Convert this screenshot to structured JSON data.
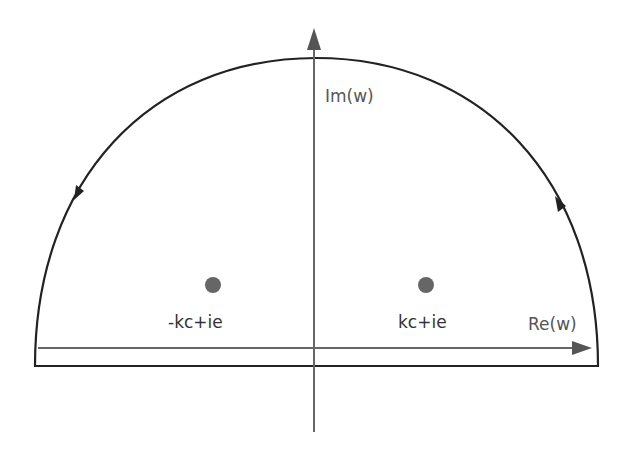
{
  "diagram": {
    "axes": {
      "imaginary_label": "Im(w)",
      "real_label": "Re(w)"
    },
    "poles": [
      {
        "label": "-kc+ie",
        "position": "left"
      },
      {
        "label": "kc+ie",
        "position": "right"
      }
    ],
    "contour": {
      "shape": "semicircle",
      "direction": "counterclockwise",
      "arrows": [
        "right-arc-up",
        "left-arc-down"
      ]
    },
    "colors": {
      "contour": "#222222",
      "axes": "#666666",
      "poles": "#666666",
      "text": "#555555"
    }
  }
}
